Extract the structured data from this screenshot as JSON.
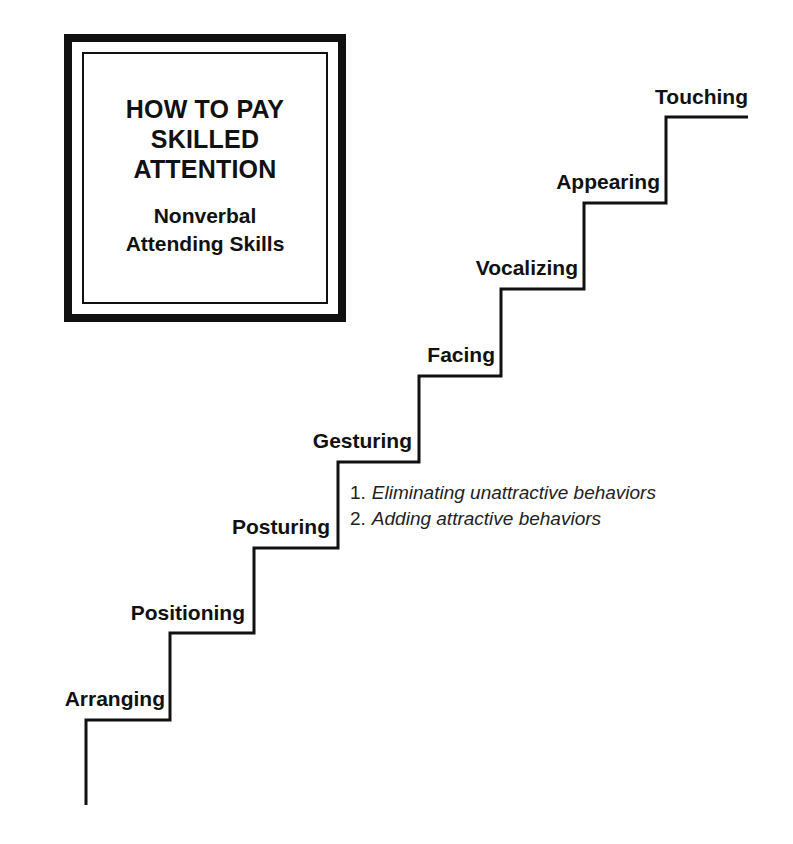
{
  "title_box": {
    "main_lines": [
      "HOW TO PAY",
      "SKILLED",
      "ATTENTION"
    ],
    "sub_lines": [
      "Nonverbal",
      "Attending Skills"
    ]
  },
  "steps": [
    {
      "label": "Arranging"
    },
    {
      "label": "Positioning"
    },
    {
      "label": "Posturing"
    },
    {
      "label": "Gesturing"
    },
    {
      "label": "Facing"
    },
    {
      "label": "Vocalizing"
    },
    {
      "label": "Appearing"
    },
    {
      "label": "Touching"
    }
  ],
  "notes": [
    {
      "num": "1.",
      "text": "Eliminating unattractive behaviors"
    },
    {
      "num": "2.",
      "text": "Adding attractive behaviors"
    }
  ],
  "colors": {
    "line": "#111111",
    "background": "#ffffff"
  }
}
